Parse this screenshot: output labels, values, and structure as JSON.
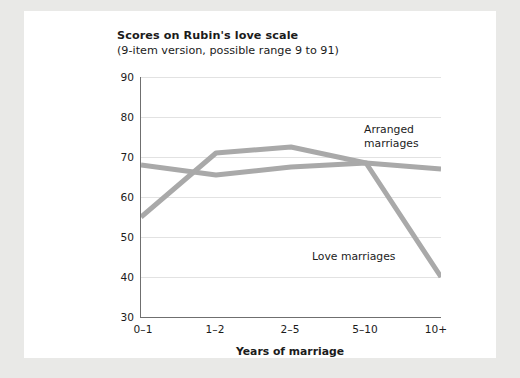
{
  "figure": {
    "background_color": "#e9e9e7",
    "card_color": "#ffffff"
  },
  "chart_data": {
    "type": "line",
    "title": "Scores on Rubin's love scale",
    "subtitle": "(9-item version, possible range 9 to 91)",
    "xlabel": "Years of marriage",
    "ylabel": "",
    "categories": [
      "0–1",
      "1–2",
      "2–5",
      "5–10",
      "10+"
    ],
    "ytick_labels": [
      "90",
      "80",
      "70",
      "60",
      "50",
      "40",
      "30"
    ],
    "yticks": [
      90,
      80,
      70,
      60,
      50,
      40,
      30
    ],
    "ylim": [
      30,
      90
    ],
    "grid": true,
    "legend_position": "inline-annotations",
    "series": [
      {
        "name": "Arranged marriages",
        "label_line1": "Arranged",
        "label_line2": "marriages",
        "color": "#a9a9a9",
        "values": [
          68,
          65.5,
          67.5,
          68.5,
          67
        ]
      },
      {
        "name": "Love marriages",
        "label_line1": "Love marriages",
        "label_line2": "",
        "color": "#a9a9a9",
        "values": [
          55,
          71,
          72.5,
          68.5,
          40
        ]
      }
    ],
    "annotations": [
      {
        "text": "Arranged marriages",
        "target_series": "Arranged marriages"
      },
      {
        "text": "Love marriages",
        "target_series": "Love marriages"
      }
    ],
    "axis_color": "#6f6f6f",
    "gridline_color": "#e2e2e2"
  }
}
